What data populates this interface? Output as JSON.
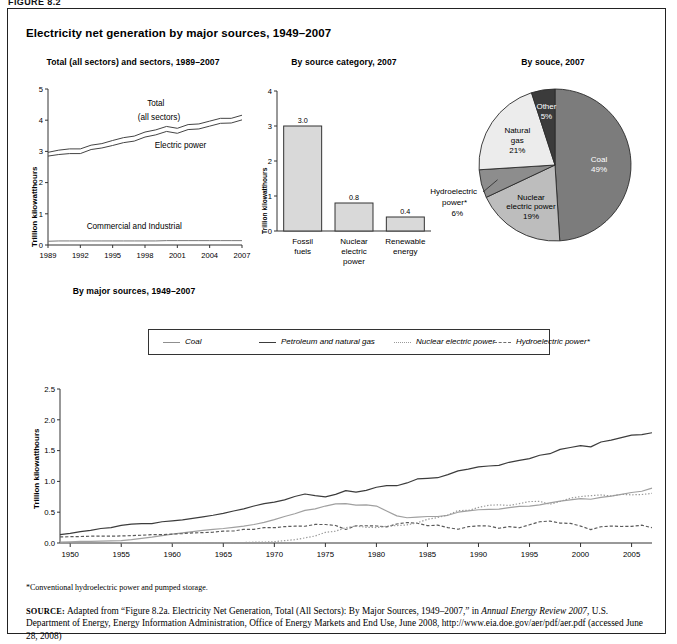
{
  "figure_tag": "FIGURE 8.2",
  "title": "Electricity net generation by major sources, 1949–2007",
  "panel1": {
    "title": "Total (all sectors) and sectors, 1989–2007",
    "ylabel": "Trillion kilowatthours",
    "subtitle_below": "By major sources, 1949–2007",
    "series_labels": {
      "total": "Total",
      "total2": "(all sectors)",
      "electric": "Electric power",
      "commercial": "Commercial and Industrial"
    }
  },
  "panel2": {
    "title": "By source category, 2007",
    "ylabel": "Trillion kilowatthours"
  },
  "panel3": {
    "title": "By souce, 2007",
    "callout_label_1": "Hydroelectric",
    "callout_label_2": "power*",
    "callout_label_3": "6%"
  },
  "legend": {
    "items": [
      {
        "label": "Coal",
        "style": "solid",
        "color": "#8f8f8f"
      },
      {
        "label": "Petroleum and natural gas",
        "style": "solid",
        "color": "#3c3c3c"
      },
      {
        "label": "Nuclear electric power",
        "style": "dotted",
        "color": "#9a9a9a"
      },
      {
        "label": "Hydroelectric power*",
        "style": "dashed",
        "color": "#6e6e6e"
      }
    ]
  },
  "footnote": "*Conventional hydroelectric power and pumped storage.",
  "source": {
    "prefix": "SOURCE:",
    "part1": " Adapted from “Figure 8.2a. Electricity Net Generation, Total (All Sectors): By Major Sources, 1949–2007,” in ",
    "italic1": "Annual Energy Review 2007",
    "part2": ", U.S. Department of Energy, Energy Information Administration, Office of Energy Markets and End Use, June 2008, http://www.eia.doe.gov/aer/pdf/aer.pdf (accessed June 28, 2008)"
  },
  "chart_data": [
    {
      "type": "line",
      "id": "panel1-lines",
      "title": "Total (all sectors) and sectors, 1989–2007",
      "xlabel": "",
      "ylabel": "Trillion kilowatthours",
      "ylim": [
        0,
        5
      ],
      "yticks": [
        0,
        1,
        2,
        3,
        4,
        5
      ],
      "ytick_labels": [
        "0",
        "1",
        "2",
        "3",
        "4",
        "5"
      ],
      "xlim": [
        1989,
        2007
      ],
      "xticks": [
        1989,
        1992,
        1995,
        1998,
        2001,
        2004,
        2007
      ],
      "xtick_labels": [
        "1989",
        "1992",
        "1995",
        "1998",
        "2001",
        "2004",
        "2007"
      ],
      "grid": false,
      "legend_position": "inline-annotations",
      "x": [
        1989,
        1990,
        1991,
        1992,
        1993,
        1994,
        1995,
        1996,
        1997,
        1998,
        1999,
        2000,
        2001,
        2002,
        2003,
        2004,
        2005,
        2006,
        2007
      ],
      "series": [
        {
          "name": "Total (all sectors)",
          "values": [
            2.97,
            3.04,
            3.08,
            3.08,
            3.2,
            3.25,
            3.35,
            3.44,
            3.49,
            3.62,
            3.69,
            3.8,
            3.74,
            3.86,
            3.88,
            3.97,
            4.06,
            4.06,
            4.16
          ]
        },
        {
          "name": "Electric power",
          "values": [
            2.85,
            2.9,
            2.93,
            2.93,
            3.06,
            3.11,
            3.19,
            3.28,
            3.33,
            3.46,
            3.53,
            3.64,
            3.58,
            3.7,
            3.72,
            3.81,
            3.9,
            3.91,
            4.01
          ]
        },
        {
          "name": "Commercial and Industrial",
          "values": [
            0.12,
            0.13,
            0.13,
            0.13,
            0.13,
            0.13,
            0.13,
            0.13,
            0.13,
            0.13,
            0.13,
            0.14,
            0.14,
            0.14,
            0.14,
            0.14,
            0.14,
            0.14,
            0.14
          ]
        }
      ]
    },
    {
      "type": "bar",
      "id": "panel2-bars",
      "title": "By source category, 2007",
      "xlabel": "",
      "ylabel": "Trillion kilowatthours",
      "ylim": [
        0,
        4
      ],
      "yticks": [
        0,
        1,
        2,
        3,
        4
      ],
      "ytick_labels": [
        "0",
        "1",
        "2",
        "3",
        "4"
      ],
      "grid": false,
      "categories": [
        "Fossil fuels",
        "Nuclear electric power",
        "Renewable energy"
      ],
      "category_lines": [
        [
          "Fossil",
          "fuels"
        ],
        [
          "Nuclear",
          "electric",
          "power"
        ],
        [
          "Renewable",
          "energy"
        ]
      ],
      "values": [
        3.0,
        0.8,
        0.4
      ],
      "value_labels": [
        "3.0",
        "0.8",
        "0.4"
      ],
      "bar_fill": "#d9d9d9",
      "bar_stroke": "#333333"
    },
    {
      "type": "pie",
      "id": "panel3-pie",
      "title": "By souce, 2007",
      "slices": [
        {
          "label": "Coal",
          "value": 49,
          "value_label": "49%",
          "color": "#7c7c7c",
          "label_color": "#ffffff"
        },
        {
          "label": "Nuclear electric power",
          "value": 19,
          "value_label": "19%",
          "color": "#bdbdbd",
          "label_color": "#000000"
        },
        {
          "label": "Hydroelectric power*",
          "value": 6,
          "value_label": "6%",
          "color": "#8d8d8d",
          "label_color": "#000000"
        },
        {
          "label": "Natural gas",
          "value": 21,
          "value_label": "21%",
          "color": "#ececec",
          "label_color": "#000000"
        },
        {
          "label": "Other",
          "value": 5,
          "value_label": "5%",
          "color": "#3b3b3b",
          "label_color": "#ffffff"
        }
      ],
      "legend_position": "callouts-on-slices"
    },
    {
      "type": "line",
      "id": "main-lines",
      "title": "By major sources, 1949–2007",
      "xlabel": "",
      "ylabel": "Trillion kilowatthours",
      "ylim": [
        0,
        2.5
      ],
      "yticks": [
        0.0,
        0.5,
        1.0,
        1.5,
        2.0,
        2.5
      ],
      "ytick_labels": [
        "0.0",
        "0.5",
        "1.0",
        "1.5",
        "2.0",
        "2.5"
      ],
      "xlim": [
        1949,
        2007
      ],
      "xticks": [
        1950,
        1955,
        1960,
        1965,
        1970,
        1975,
        1980,
        1985,
        1990,
        1995,
        2000,
        2005
      ],
      "xtick_labels": [
        "1950",
        "1955",
        "1960",
        "1965",
        "1970",
        "1975",
        "1980",
        "1985",
        "1990",
        "1995",
        "2000",
        "2005"
      ],
      "grid": false,
      "legend_position": "top",
      "x": [
        1949,
        1950,
        1951,
        1952,
        1953,
        1954,
        1955,
        1956,
        1957,
        1958,
        1959,
        1960,
        1961,
        1962,
        1963,
        1964,
        1965,
        1966,
        1967,
        1968,
        1969,
        1970,
        1971,
        1972,
        1973,
        1974,
        1975,
        1976,
        1977,
        1978,
        1979,
        1980,
        1981,
        1982,
        1983,
        1984,
        1985,
        1986,
        1987,
        1988,
        1989,
        1990,
        1991,
        1992,
        1993,
        1994,
        1995,
        1996,
        1997,
        1998,
        1999,
        2000,
        2001,
        2002,
        2003,
        2004,
        2005,
        2006,
        2007
      ],
      "series": [
        {
          "name": "Petroleum and natural gas",
          "values": [
            0.135,
            0.155,
            0.185,
            0.205,
            0.235,
            0.25,
            0.285,
            0.305,
            0.315,
            0.315,
            0.345,
            0.36,
            0.375,
            0.4,
            0.425,
            0.45,
            0.48,
            0.52,
            0.555,
            0.6,
            0.64,
            0.665,
            0.7,
            0.755,
            0.795,
            0.77,
            0.75,
            0.79,
            0.85,
            0.825,
            0.855,
            0.905,
            0.93,
            0.93,
            0.975,
            1.04,
            1.05,
            1.06,
            1.11,
            1.17,
            1.2,
            1.235,
            1.25,
            1.26,
            1.31,
            1.34,
            1.37,
            1.425,
            1.45,
            1.52,
            1.55,
            1.58,
            1.56,
            1.64,
            1.67,
            1.71,
            1.75,
            1.76,
            1.79
          ],
          "style": "solid",
          "color": "#3c3c3c"
        },
        {
          "name": "Coal",
          "values": [
            0.015,
            0.02,
            0.025,
            0.028,
            0.032,
            0.035,
            0.04,
            0.055,
            0.075,
            0.095,
            0.12,
            0.145,
            0.165,
            0.185,
            0.205,
            0.22,
            0.235,
            0.255,
            0.275,
            0.3,
            0.335,
            0.38,
            0.43,
            0.475,
            0.53,
            0.555,
            0.6,
            0.635,
            0.64,
            0.615,
            0.62,
            0.6,
            0.52,
            0.44,
            0.41,
            0.42,
            0.43,
            0.43,
            0.45,
            0.5,
            0.52,
            0.54,
            0.545,
            0.55,
            0.575,
            0.595,
            0.6,
            0.62,
            0.65,
            0.68,
            0.7,
            0.72,
            0.71,
            0.74,
            0.76,
            0.79,
            0.82,
            0.84,
            0.89
          ],
          "style": "solid",
          "color": "#a0a0a0"
        },
        {
          "name": "Hydroelectric power*",
          "values": [
            0.1,
            0.102,
            0.105,
            0.11,
            0.112,
            0.11,
            0.115,
            0.12,
            0.126,
            0.135,
            0.135,
            0.145,
            0.152,
            0.165,
            0.168,
            0.176,
            0.194,
            0.195,
            0.222,
            0.222,
            0.25,
            0.248,
            0.266,
            0.273,
            0.272,
            0.301,
            0.3,
            0.284,
            0.22,
            0.28,
            0.28,
            0.276,
            0.261,
            0.309,
            0.332,
            0.321,
            0.281,
            0.29,
            0.25,
            0.223,
            0.265,
            0.28,
            0.276,
            0.239,
            0.266,
            0.247,
            0.296,
            0.345,
            0.356,
            0.323,
            0.319,
            0.275,
            0.217,
            0.264,
            0.275,
            0.268,
            0.27,
            0.289,
            0.248
          ],
          "style": "dashed",
          "color": "#5a5a5a"
        },
        {
          "name": "Nuclear electric power",
          "values": [
            0.0,
            0.0,
            0.0,
            0.0,
            0.0,
            0.0,
            0.0,
            0.0,
            0.0,
            0.0,
            0.0,
            0.001,
            0.002,
            0.002,
            0.003,
            0.003,
            0.004,
            0.006,
            0.008,
            0.013,
            0.014,
            0.022,
            0.038,
            0.054,
            0.083,
            0.114,
            0.173,
            0.191,
            0.251,
            0.276,
            0.255,
            0.251,
            0.273,
            0.283,
            0.294,
            0.328,
            0.384,
            0.414,
            0.455,
            0.527,
            0.529,
            0.577,
            0.613,
            0.619,
            0.61,
            0.64,
            0.673,
            0.675,
            0.629,
            0.674,
            0.728,
            0.754,
            0.769,
            0.78,
            0.764,
            0.789,
            0.782,
            0.787,
            0.806
          ],
          "style": "dotted",
          "color": "#9a9a9a"
        }
      ]
    }
  ]
}
